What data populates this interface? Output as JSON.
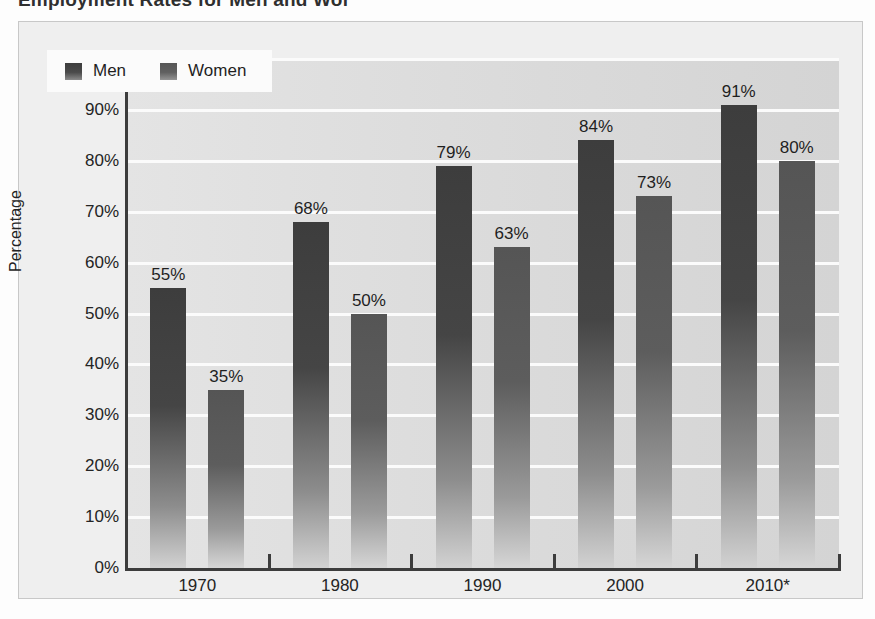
{
  "document": {
    "cut_off_title": "Employment Rates for Men and Women"
  },
  "chart_data": {
    "type": "bar",
    "title": "",
    "xlabel": "",
    "ylabel": "Percentage",
    "categories": [
      "1970",
      "1980",
      "1990",
      "2000",
      "2010*"
    ],
    "series": [
      {
        "name": "Men",
        "color": "#434343",
        "values": [
          55,
          68,
          79,
          84,
          91
        ],
        "labels": [
          "55%",
          "68%",
          "79%",
          "84%",
          "91%"
        ]
      },
      {
        "name": "Women",
        "color": "#5b5b5b",
        "values": [
          35,
          50,
          63,
          73,
          80
        ],
        "labels": [
          "35%",
          "50%",
          "63%",
          "73%",
          "80%"
        ]
      }
    ],
    "ylim": [
      0,
      100
    ],
    "ytick_values": [
      100,
      90,
      80,
      70,
      60,
      50,
      40,
      30,
      20,
      10,
      0
    ],
    "ytick_labels": [
      "100%",
      "90%",
      "80%",
      "70%",
      "60%",
      "50%",
      "40%",
      "30%",
      "20%",
      "10%",
      "0%"
    ],
    "grid": "horizontal",
    "legend_position": "top-left",
    "legend_entries": [
      "Men",
      "Women"
    ],
    "plot_background": "#dedede",
    "gridline_color": "#fbfbfb",
    "axis_color": "#3c3c3c"
  }
}
